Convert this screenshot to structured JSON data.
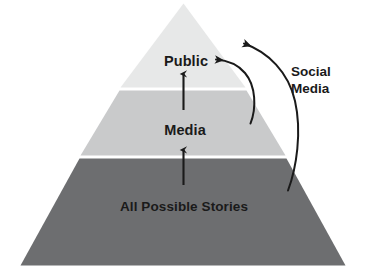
{
  "diagram": {
    "type": "pyramid-flow-diagram",
    "background_color": "#ffffff",
    "text_color": "#1a1a1a",
    "arrow_color": "#1a1a1a",
    "tiers": [
      {
        "id": "public",
        "label": "Public",
        "position": "top",
        "fill_color": "#e7e8e8"
      },
      {
        "id": "media",
        "label": "Media",
        "position": "middle",
        "fill_color": "#c9cacb"
      },
      {
        "id": "all-possible-stories",
        "label": "All Possible Stories",
        "position": "bottom",
        "fill_color": "#6d6e70"
      }
    ],
    "annotations": [
      {
        "id": "social-media",
        "line1": "Social",
        "line2": "Media"
      }
    ],
    "flow_arrows": [
      {
        "id": "stories-to-media",
        "from": "all-possible-stories",
        "to": "media",
        "direction": "up"
      },
      {
        "id": "media-to-public",
        "from": "media",
        "to": "public",
        "direction": "up"
      },
      {
        "id": "social-media-from-media-to-public",
        "from": "media",
        "to": "public",
        "direction": "curved"
      },
      {
        "id": "social-media-from-stories-to-public",
        "from": "all-possible-stories",
        "to": "public",
        "direction": "curved"
      }
    ]
  }
}
